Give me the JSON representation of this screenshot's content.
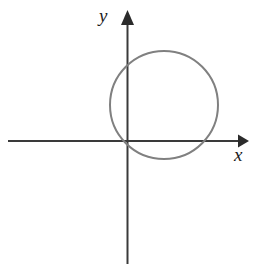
{
  "figure": {
    "width": 263,
    "height": 267,
    "background_color": "#ffffff",
    "type": "coordinate-plane-diagram"
  },
  "axes": {
    "x_axis": {
      "label": "x",
      "color": "#3a3a3a",
      "stroke_width": 2,
      "line_y": 141,
      "line_x_start": 8,
      "line_x_end": 238,
      "arrow_tip_x": 249,
      "arrow": "right",
      "label_position": {
        "left": 234,
        "top": 145
      }
    },
    "y_axis": {
      "label": "y",
      "color": "#3a3a3a",
      "stroke_width": 2,
      "line_x": 127,
      "line_y_start": 22,
      "line_y_end": 264,
      "arrow_tip_y": 10,
      "arrow": "up",
      "label_position": {
        "left": 99,
        "top": 6
      }
    }
  },
  "chart_data": {
    "type": "scatter",
    "title": "",
    "xlabel": "x",
    "ylabel": "y",
    "grid": false,
    "legend": false,
    "shapes": [
      {
        "name": "circle",
        "kind": "circle",
        "center_px": [
          164,
          105
        ],
        "radius_px": 54,
        "stroke_color": "#808080",
        "stroke_width": 2,
        "fill": "none",
        "bounds_px": {
          "left": 110,
          "right": 218,
          "top": 51,
          "bottom": 159
        }
      }
    ]
  },
  "colors": {
    "axis": "#3a3a3a",
    "curve": "#808080",
    "background": "#ffffff",
    "label_text": "#1c1c1c"
  }
}
